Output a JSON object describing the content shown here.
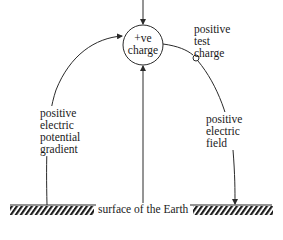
{
  "diagram": {
    "source_charge": {
      "lines": [
        "+ve",
        "charge"
      ]
    },
    "test_charge": {
      "lines": [
        "positive",
        "test",
        "charge"
      ]
    },
    "potential_gradient": {
      "lines": [
        "positive",
        "electric",
        "potential",
        "gradient"
      ]
    },
    "electric_field": {
      "lines": [
        "positive",
        "electric",
        "field"
      ]
    },
    "ground": {
      "label": "surface of the Earth"
    },
    "colors": {
      "stroke": "#2a2a2a",
      "text": "#1a1a1a",
      "background": "#ffffff"
    }
  }
}
